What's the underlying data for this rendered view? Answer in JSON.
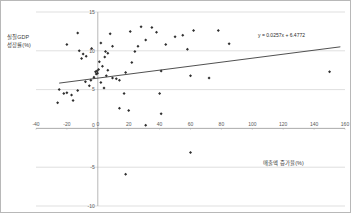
{
  "chart_data": {
    "type": "scatter",
    "title": "",
    "xlabel": "매출액 증가율(%)",
    "ylabel": "실질GDP 성장률(%)",
    "xlim": [
      -40,
      160
    ],
    "ylim": [
      -10,
      15
    ],
    "xticks": [
      -40,
      -20,
      0,
      20,
      40,
      60,
      80,
      100,
      120,
      140,
      160
    ],
    "yticks": [
      -10,
      -5,
      0,
      5,
      10,
      15
    ],
    "grid": true,
    "grid_axis": "y",
    "legend": "none",
    "trendline": {
      "equation": "y = 0.0257x + 6.4772",
      "slope": 0.0257,
      "intercept": 6.4772,
      "x_start": -25,
      "x_end": 157
    },
    "points": [
      [
        -13.0,
        12.3
      ],
      [
        -20.0,
        10.8
      ],
      [
        -12.0,
        10.0
      ],
      [
        -9.5,
        9.6
      ],
      [
        -10.5,
        9.0
      ],
      [
        -7.5,
        9.3
      ],
      [
        -4.0,
        10.3
      ],
      [
        2.0,
        11.0
      ],
      [
        8.0,
        12.2
      ],
      [
        9.5,
        10.6
      ],
      [
        5.0,
        9.9
      ],
      [
        6.5,
        9.7
      ],
      [
        4.5,
        9.2
      ],
      [
        1.0,
        8.6
      ],
      [
        3.0,
        8.0
      ],
      [
        0.5,
        7.6
      ],
      [
        -0.5,
        7.4
      ],
      [
        -1.5,
        7.3
      ],
      [
        -0.2,
        7.1
      ],
      [
        -1.0,
        7.0
      ],
      [
        -2.5,
        6.6
      ],
      [
        6.5,
        7.5
      ],
      [
        5.5,
        6.8
      ],
      [
        9.5,
        6.5
      ],
      [
        -4.5,
        6.2
      ],
      [
        -8.0,
        6.0
      ],
      [
        -5.5,
        5.5
      ],
      [
        -13.0,
        4.9
      ],
      [
        -17.0,
        4.3
      ],
      [
        -20.0,
        4.6
      ],
      [
        -22.0,
        4.5
      ],
      [
        -16.0,
        3.6
      ],
      [
        -25.0,
        5.0
      ],
      [
        2.0,
        5.9
      ],
      [
        4.0,
        5.2
      ],
      [
        12.0,
        6.4
      ],
      [
        14.0,
        6.2
      ],
      [
        18.0,
        7.2
      ],
      [
        17.0,
        4.5
      ],
      [
        21.0,
        12.5
      ],
      [
        24.0,
        9.9
      ],
      [
        22.0,
        8.5
      ],
      [
        26.0,
        10.6
      ],
      [
        28.0,
        13.1
      ],
      [
        31.0,
        11.4
      ],
      [
        35.0,
        13.0
      ],
      [
        38.0,
        12.4
      ],
      [
        41.0,
        7.4
      ],
      [
        44.0,
        10.8
      ],
      [
        40.0,
        4.5
      ],
      [
        50.0,
        11.8
      ],
      [
        55.0,
        12.0
      ],
      [
        58.0,
        10.2
      ],
      [
        62.0,
        12.6
      ],
      [
        60.0,
        6.8
      ],
      [
        72.0,
        6.5
      ],
      [
        78.0,
        12.6
      ],
      [
        85.0,
        10.9
      ],
      [
        150.0,
        7.3
      ],
      [
        -26.0,
        3.3
      ],
      [
        14.0,
        2.6
      ],
      [
        20.0,
        2.3
      ],
      [
        41.0,
        1.9
      ],
      [
        31.0,
        0.4
      ],
      [
        60.0,
        -3.1
      ],
      [
        18.0,
        -5.9
      ]
    ]
  }
}
